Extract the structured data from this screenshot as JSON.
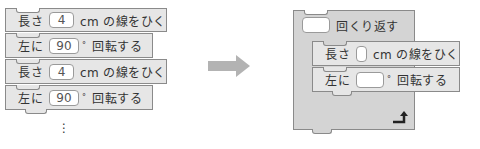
{
  "left_stack": {
    "blocks": [
      {
        "prefix": "長さ",
        "value": "4",
        "suffix": "cm の線をひく"
      },
      {
        "prefix": "左に",
        "value": "90",
        "unit": "°",
        "suffix": "回転する"
      },
      {
        "prefix": "長さ",
        "value": "4",
        "suffix": "cm の線をひく"
      },
      {
        "prefix": "左に",
        "value": "90",
        "unit": "°",
        "suffix": "回転する"
      }
    ],
    "continuation": "⋮"
  },
  "arrow": {
    "color": "#b3b3b3",
    "direction": "right"
  },
  "right_stack": {
    "repeat": {
      "value": "",
      "label": "回くり返す"
    },
    "inner": [
      {
        "prefix": "長さ",
        "value": "",
        "suffix": "cm の線をひく"
      },
      {
        "prefix": "左に",
        "value": "",
        "unit": "°",
        "suffix": "回転する"
      }
    ],
    "loop_icon": "loop-arrow-icon"
  },
  "colors": {
    "block_fill": "#e6e6e6",
    "repeat_fill": "#d4d4d4",
    "border": "#8a8a8a"
  }
}
